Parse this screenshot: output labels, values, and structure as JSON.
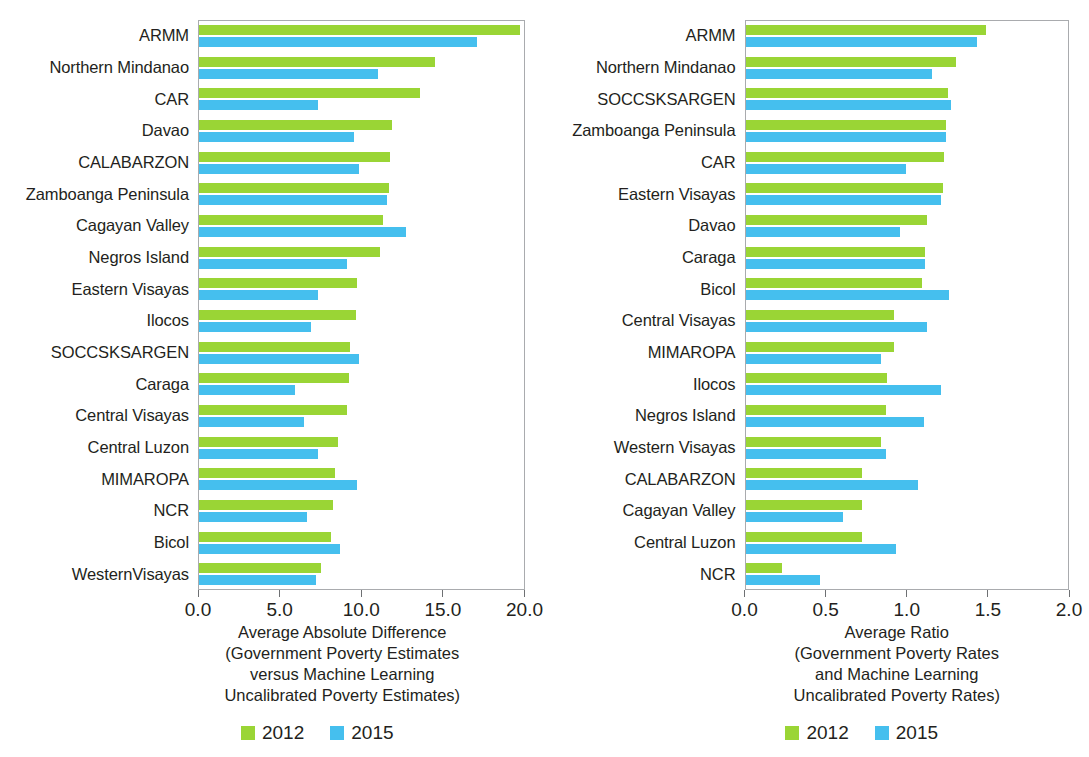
{
  "legend": {
    "items": [
      {
        "label": "2012",
        "color": "#9ad535",
        "key": "y2012"
      },
      {
        "label": "2015",
        "color": "#45bfee",
        "key": "y2015"
      }
    ]
  },
  "colors": {
    "series_2012": "#9ad535",
    "series_2015": "#45bfee",
    "axis": "#a9abae",
    "text": "#231f20",
    "background": "#ffffff"
  },
  "panels": {
    "left": {
      "axis_title_lines": [
        "Average Absolute Difference",
        "(Government Poverty Estimates",
        "versus Machine Learning",
        "Uncalibrated Poverty Estimates)"
      ],
      "tick_labels": [
        "0.0",
        "5.0",
        "10.0",
        "15.0",
        "20.0"
      ]
    },
    "right": {
      "axis_title_lines": [
        "Average Ratio",
        "(Government Poverty Rates",
        "and Machine Learning",
        "Uncalibrated Poverty Rates)"
      ],
      "tick_labels": [
        "0.0",
        "0.5",
        "1.0",
        "1.5",
        "2.0"
      ]
    }
  },
  "chart_data": [
    {
      "type": "bar",
      "orientation": "horizontal",
      "panel": "left",
      "title": "",
      "xlabel": "Average Absolute Difference (Government Poverty Estimates versus Machine Learning Uncalibrated Poverty Estimates)",
      "ylabel": "",
      "xlim": [
        0.0,
        20.0
      ],
      "xticks": [
        0.0,
        5.0,
        10.0,
        15.0,
        20.0
      ],
      "grid": false,
      "legend_position": "bottom-center",
      "categories": [
        "ARMM",
        "Northern Mindanao",
        "CAR",
        "Davao",
        "CALABARZON",
        "Zamboanga Peninsula",
        "Cagayan Valley",
        "Negros Island",
        "Eastern Visayas",
        "Ilocos",
        "SOCCSKSARGEN",
        "Caraga",
        "Central Visayas",
        "Central Luzon",
        "MIMAROPA",
        "NCR",
        "Bicol",
        "WesternVisayas"
      ],
      "series": [
        {
          "name": "2012",
          "color": "#9ad535",
          "values": [
            18.6,
            13.7,
            12.8,
            11.2,
            11.1,
            11.0,
            10.7,
            10.5,
            9.2,
            9.1,
            8.8,
            8.7,
            8.6,
            8.1,
            7.9,
            7.8,
            7.7,
            7.1
          ]
        },
        {
          "name": "2015",
          "color": "#45bfee",
          "values": [
            16.1,
            10.4,
            6.9,
            9.0,
            9.3,
            10.9,
            12.0,
            8.6,
            6.9,
            6.5,
            9.3,
            5.6,
            6.1,
            6.9,
            9.2,
            6.3,
            8.2,
            6.8
          ]
        }
      ]
    },
    {
      "type": "bar",
      "orientation": "horizontal",
      "panel": "right",
      "title": "",
      "xlabel": "Average Ratio (Government Poverty Rates and Machine Learning Uncalibrated Poverty Rates)",
      "ylabel": "",
      "xlim": [
        0.0,
        2.0
      ],
      "xticks": [
        0.0,
        0.5,
        1.0,
        1.5,
        2.0
      ],
      "grid": false,
      "legend_position": "bottom-center",
      "categories": [
        "ARMM",
        "Northern Mindanao",
        "SOCCSKSARGEN",
        "Zamboanga Peninsula",
        "CAR",
        "Eastern Visayas",
        "Davao",
        "Caraga",
        "Bicol",
        "Central Visayas",
        "MIMAROPA",
        "Ilocos",
        "Negros Island",
        "Western Visayas",
        "CALABARZON",
        "Cagayan Valley",
        "Central Luzon",
        "NCR"
      ],
      "series": [
        {
          "name": "2012",
          "color": "#9ad535",
          "values": [
            1.4,
            1.23,
            1.18,
            1.17,
            1.16,
            1.15,
            1.06,
            1.05,
            1.03,
            0.87,
            0.87,
            0.83,
            0.82,
            0.79,
            0.68,
            0.68,
            0.68,
            0.22
          ]
        },
        {
          "name": "2015",
          "color": "#45bfee",
          "values": [
            1.35,
            1.09,
            1.2,
            1.17,
            0.94,
            1.14,
            0.9,
            1.05,
            1.19,
            1.06,
            0.79,
            1.14,
            1.04,
            0.82,
            1.01,
            0.57,
            0.88,
            0.44
          ]
        }
      ]
    }
  ]
}
